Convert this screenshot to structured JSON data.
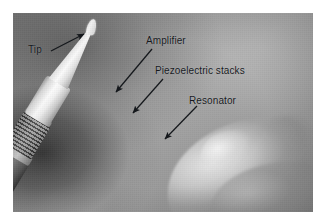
{
  "figure": {
    "type": "annotated-photograph",
    "background": "#9a9a9a",
    "annotation_color": "#15181c"
  },
  "labels": [
    {
      "id": "tip",
      "text": "Tip",
      "name": "label-tip",
      "arrow": {
        "from": [
          51,
          51
        ],
        "to": [
          84,
          34
        ]
      }
    },
    {
      "id": "amplifier",
      "text": "Amplifier",
      "name": "label-amplifier",
      "arrow": {
        "from": [
          152,
          49
        ],
        "to": [
          116,
          92
        ]
      }
    },
    {
      "id": "piezoelectric_stacks",
      "text": "Piezoelectric stacks",
      "name": "label-piezoelectric-stacks",
      "arrow": {
        "from": [
          163,
          79
        ],
        "to": [
          133,
          113
        ]
      }
    },
    {
      "id": "resonator",
      "text": "Resonator",
      "name": "label-resonator",
      "arrow": {
        "from": [
          197,
          106
        ],
        "to": [
          165,
          139
        ]
      }
    }
  ],
  "parts": [
    {
      "name": "tip",
      "description": "fine white needle tip at upper left"
    },
    {
      "name": "amplifier",
      "description": "white cylindrical barrel below the tapered cone"
    },
    {
      "name": "piezoelectric-stacks",
      "description": "dark ribbed stacked rings section"
    },
    {
      "name": "resonator",
      "description": "dark grey cylindrical block"
    },
    {
      "name": "handle",
      "description": "white handle held by the hand"
    },
    {
      "name": "hand",
      "description": "blurred thumb and fingers holding the probe, lower right"
    }
  ]
}
